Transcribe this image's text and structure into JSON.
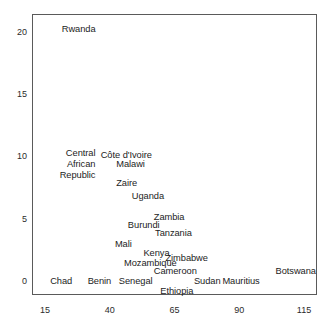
{
  "figure": {
    "type": "scatter-text-labels",
    "width": 331,
    "height": 328,
    "background": "#ffffff",
    "frame_color": "#5a5a5a"
  },
  "chart_data": {
    "type": "scatter",
    "title": "",
    "subtitle": "",
    "xlabel": "",
    "ylabel": "",
    "xlim": [
      10,
      120
    ],
    "ylim": [
      -1.1,
      21.5
    ],
    "xticks": [
      15,
      40,
      65,
      90,
      115
    ],
    "yticks": [
      0,
      5,
      10,
      15,
      20
    ],
    "xtick_labels": [
      "15",
      "40",
      "65",
      "90",
      "115"
    ],
    "ytick_labels": [
      "0",
      "5",
      "10",
      "15",
      "20"
    ],
    "grid": false,
    "legend": null,
    "marker": "none",
    "labels_as_markers": true,
    "points": [
      {
        "name": "Rwanda",
        "label": "Rwanda",
        "x": 21.5,
        "y": 20.3,
        "anchor": "left"
      },
      {
        "name": "Côte d'Ivoire",
        "label": "Côte d'Ivoire",
        "x": 36.5,
        "y": 10.2,
        "anchor": "left"
      },
      {
        "name": "Central African Republic",
        "label": "Central\nAfrican\nRepublic",
        "x": 34.5,
        "y": 9.4,
        "anchor": "right",
        "multiline": true
      },
      {
        "name": "Malawi",
        "label": "Malawi",
        "x": 42.5,
        "y": 9.4,
        "anchor": "left"
      },
      {
        "name": "Zaire",
        "label": "Zaire",
        "x": 42.5,
        "y": 7.9,
        "anchor": "left"
      },
      {
        "name": "Uganda",
        "label": "Uganda",
        "x": 48.5,
        "y": 6.9,
        "anchor": "left"
      },
      {
        "name": "Zambia",
        "label": "Zambia",
        "x": 57.0,
        "y": 5.2,
        "anchor": "left"
      },
      {
        "name": "Burundi",
        "label": "Burundi",
        "x": 47.0,
        "y": 4.5,
        "anchor": "left"
      },
      {
        "name": "Tanzania",
        "label": "Tanzania",
        "x": 57.5,
        "y": 3.9,
        "anchor": "left"
      },
      {
        "name": "Mali",
        "label": "Mali",
        "x": 42.0,
        "y": 3.0,
        "anchor": "left"
      },
      {
        "name": "Kenya",
        "label": "Kenya",
        "x": 53.0,
        "y": 2.3,
        "anchor": "left"
      },
      {
        "name": "Zimbabwe",
        "label": "Zimbabwe",
        "x": 61.5,
        "y": 1.9,
        "anchor": "left"
      },
      {
        "name": "Mozambique",
        "label": "Mozambique",
        "x": 45.5,
        "y": 1.5,
        "anchor": "left"
      },
      {
        "name": "Cameroon",
        "label": "Cameroon",
        "x": 57.0,
        "y": 0.8,
        "anchor": "left"
      },
      {
        "name": "Botswana",
        "label": "Botswana",
        "x": 104.0,
        "y": 0.8,
        "anchor": "left"
      },
      {
        "name": "Chad",
        "label": "Chad",
        "x": 17.0,
        "y": 0.05,
        "anchor": "left"
      },
      {
        "name": "Benin",
        "label": "Benin",
        "x": 31.5,
        "y": 0.05,
        "anchor": "left"
      },
      {
        "name": "Senegal",
        "label": "Senegal",
        "x": 43.5,
        "y": 0.05,
        "anchor": "left"
      },
      {
        "name": "Sudan",
        "label": "Sudan",
        "x": 72.5,
        "y": 0.05,
        "anchor": "left"
      },
      {
        "name": "Mauritius",
        "label": "Mauritius",
        "x": 83.5,
        "y": 0.05,
        "anchor": "left"
      },
      {
        "name": "Ethiopia",
        "label": "Ethiopia",
        "x": 59.5,
        "y": -0.75,
        "anchor": "left"
      }
    ]
  }
}
